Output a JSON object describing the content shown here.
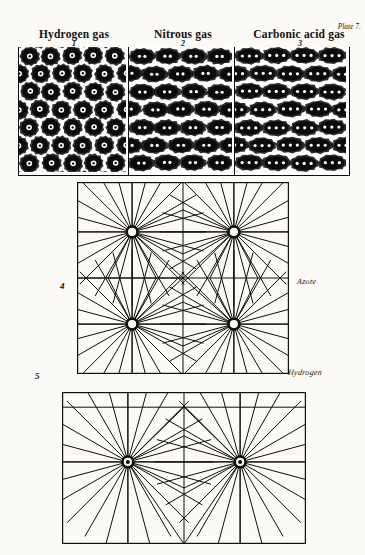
{
  "plate": {
    "label": "Plate 7.",
    "background_color": "#fbfaf7",
    "ink_color": "#100e0c"
  },
  "gas_figures": [
    {
      "number": "1",
      "title": "Hydrogen gas",
      "particle_type": "single-ring",
      "dots_per_particle": 1,
      "rows": 7,
      "cols": 5
    },
    {
      "number": "2",
      "title": "Nitrous gas",
      "particle_type": "double-lobe",
      "dots_per_particle": 2,
      "rows": 7,
      "cols": 4
    },
    {
      "number": "3",
      "title": "Carbonic acid gas",
      "particle_type": "triple-lobe",
      "dots_per_particle": 3,
      "rows": 7,
      "cols": 4
    }
  ],
  "lattice_figures": [
    {
      "number": "4",
      "label": "Azote",
      "node_style": "hollow-ring",
      "node_rows": 2,
      "node_cols": 2,
      "rays_per_node": 24
    },
    {
      "number": "5",
      "label": "Hydrogen",
      "node_style": "filled-dot",
      "node_rows": 1,
      "node_cols": 2,
      "rays_per_node": 24
    }
  ]
}
